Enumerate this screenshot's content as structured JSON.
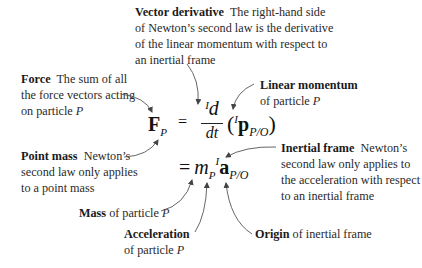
{
  "annotations": {
    "vector_derivative": {
      "title": "Vector derivative",
      "lines": [
        "The right-hand side",
        "of Newton’s second law is the derivative",
        "of the linear momentum with respect to",
        "an inertial frame"
      ]
    },
    "force": {
      "title": "Force",
      "lines": [
        "The sum of all",
        "the force vectors acting",
        "on particle "
      ],
      "var": "P"
    },
    "linear_momentum": {
      "title": "Linear momentum",
      "line2": "of particle ",
      "var": "P"
    },
    "point_mass": {
      "title": "Point mass",
      "lines": [
        "Newton’s",
        "second law only applies",
        "to a point mass"
      ]
    },
    "inertial_frame": {
      "title": "Inertial frame",
      "lines": [
        "Newton’s",
        "second law only applies to",
        "the acceleration with respect",
        "to an inertial frame"
      ]
    },
    "mass": {
      "title": "Mass",
      "text": " of particle ",
      "var": "P"
    },
    "acceleration": {
      "title": "Acceleration",
      "line2": "of particle ",
      "var": "P"
    },
    "origin": {
      "title": "Origin",
      "text": " of inertial frame"
    }
  },
  "equation": {
    "lhs_symbol": "F",
    "lhs_sub": "P",
    "equals": "=",
    "frame_sup": "I",
    "numerator": "d",
    "denominator": "dt",
    "momentum_symbol": "p",
    "rel_sub": "P/O",
    "mass_symbol": "m",
    "mass_sub": "P",
    "accel_symbol": "a"
  },
  "colors": {
    "text": "#2a2a2a",
    "arrow": "#555555",
    "background": "#ffffff"
  }
}
